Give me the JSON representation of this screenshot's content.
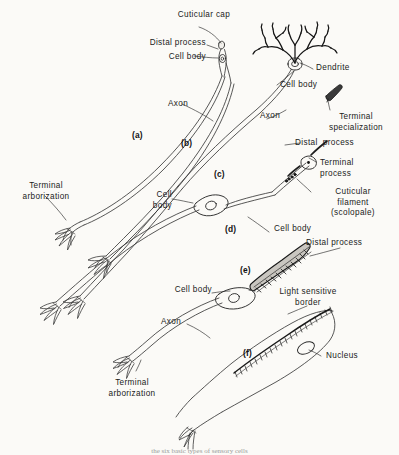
{
  "figure": {
    "background_color": "#fbfaf7",
    "ink_color": "#222222",
    "caption_partial": "the six basic types of sensory cells"
  },
  "panel_keys": [
    {
      "id": "a",
      "label": "(a)"
    },
    {
      "id": "b",
      "label": "(b)"
    },
    {
      "id": "c",
      "label": "(c)"
    },
    {
      "id": "d",
      "label": "(d)"
    },
    {
      "id": "e",
      "label": "(e)"
    },
    {
      "id": "f",
      "label": "(f)"
    }
  ],
  "labels": {
    "cuticular_cap": "Cuticular cap",
    "distal_process_top": "Distal process",
    "cell_body_top": "Cell body",
    "axon_a": "Axon",
    "terminal_arborization_left": "Terminal\narborization",
    "dendrite": "Dendrite",
    "cell_body_dendritic": "Cell body",
    "axon_c": "Axon",
    "terminal_specialization": "Terminal\nspecialization",
    "distal_process_c": "Distal  process",
    "terminal_process": "Terminal\nprocess",
    "cuticular_filament": "Cuticular\nfilament\n(scolopale)",
    "cell_body_c": "Cell\nbody",
    "cell_body_d": "Cell body",
    "distal_process_e": "Distal process",
    "cell_body_e": "Cell body",
    "light_sensitive_border": "Light sensitive\nborder",
    "axon_e": "Axon",
    "nucleus": "Nucleus",
    "terminal_arborization_bottom": "Terminal\narborization"
  }
}
